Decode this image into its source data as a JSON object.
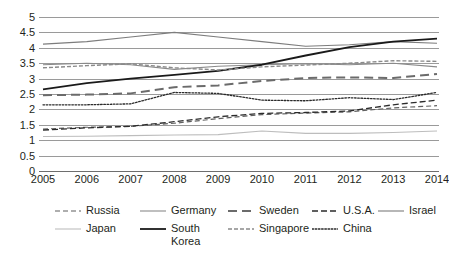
{
  "chart_data": {
    "type": "line",
    "title": "",
    "xlabel": "",
    "ylabel": "",
    "x": [
      2005,
      2006,
      2007,
      2008,
      2009,
      2010,
      2011,
      2012,
      2013,
      2014
    ],
    "categories": [
      "2005",
      "2006",
      "2007",
      "2008",
      "2009",
      "2010",
      "2011",
      "2012",
      "2013",
      "2014"
    ],
    "ylim": [
      0,
      5
    ],
    "ytick_values": [
      0,
      0.5,
      1,
      1.5,
      2,
      2.5,
      3,
      3.5,
      4,
      4.5,
      5
    ],
    "ytick_labels": [
      "0",
      "0.5",
      "1",
      "1.5",
      "2",
      "2.5",
      "3",
      "3.5",
      "4",
      "4.5",
      "5"
    ],
    "grid": true,
    "legend_position": "bottom",
    "series": [
      {
        "name": "Russia",
        "style": "dashed",
        "color": "#5f5f5f",
        "width": 1.2,
        "dash": "5,3",
        "values": [
          1.36,
          1.42,
          1.45,
          1.55,
          1.7,
          1.83,
          1.88,
          1.92,
          2.05,
          2.12
        ]
      },
      {
        "name": "Germany",
        "style": "solid",
        "color": "#8a8a8a",
        "width": 1.1,
        "dash": "",
        "values": [
          3.45,
          3.5,
          3.45,
          3.3,
          3.4,
          3.45,
          3.48,
          3.45,
          3.5,
          3.38
        ]
      },
      {
        "name": "Sweden",
        "style": "dashed",
        "color": "#6b6b6b",
        "width": 2.0,
        "dash": "9,5",
        "values": [
          2.46,
          2.48,
          2.52,
          2.72,
          2.78,
          2.92,
          3.02,
          3.04,
          3.02,
          3.15
        ]
      },
      {
        "name": "U.S.A.",
        "style": "dashed",
        "color": "#2b2b2b",
        "width": 1.3,
        "dash": "6,3",
        "values": [
          1.33,
          1.4,
          1.45,
          1.6,
          1.76,
          1.87,
          1.9,
          1.95,
          2.15,
          2.3
        ]
      },
      {
        "name": "Israel",
        "style": "solid",
        "color": "#7d7d7d",
        "width": 1.1,
        "dash": "",
        "values": [
          4.12,
          4.2,
          4.35,
          4.5,
          4.35,
          4.2,
          4.05,
          4.1,
          4.2,
          4.15
        ]
      },
      {
        "name": "Japan",
        "style": "solid",
        "color": "#bdbdbd",
        "width": 1.1,
        "dash": "",
        "values": [
          1.12,
          1.13,
          1.15,
          1.17,
          1.18,
          1.3,
          1.22,
          1.22,
          1.25,
          1.3
        ]
      },
      {
        "name": "South Korea",
        "style": "solid",
        "color": "#1a1a1a",
        "width": 1.8,
        "dash": "",
        "values": [
          2.65,
          2.85,
          3.0,
          3.12,
          3.25,
          3.45,
          3.75,
          4.02,
          4.2,
          4.3
        ]
      },
      {
        "name": "Singapore",
        "style": "dashed",
        "color": "#8a8a8a",
        "width": 1.4,
        "dash": "4,2",
        "values": [
          3.35,
          3.42,
          3.48,
          3.35,
          3.28,
          3.38,
          3.44,
          3.5,
          3.58,
          3.56
        ]
      },
      {
        "name": "China",
        "style": "dotted",
        "color": "#2b2b2b",
        "width": 1.3,
        "dash": "1.6,1.6",
        "values": [
          2.15,
          2.15,
          2.18,
          2.55,
          2.52,
          2.3,
          2.28,
          2.38,
          2.32,
          2.55
        ]
      }
    ]
  },
  "legend": {
    "items": [
      {
        "label": "Russia",
        "series": 0
      },
      {
        "label": "Germany",
        "series": 1
      },
      {
        "label": "Sweden",
        "series": 2
      },
      {
        "label": "U.S.A.",
        "series": 3
      },
      {
        "label": "Israel",
        "series": 4
      },
      {
        "label": "Japan",
        "series": 5
      },
      {
        "label": "South Korea",
        "series": 6
      },
      {
        "label": "Singapore",
        "series": 7
      },
      {
        "label": "China",
        "series": 8
      }
    ]
  }
}
